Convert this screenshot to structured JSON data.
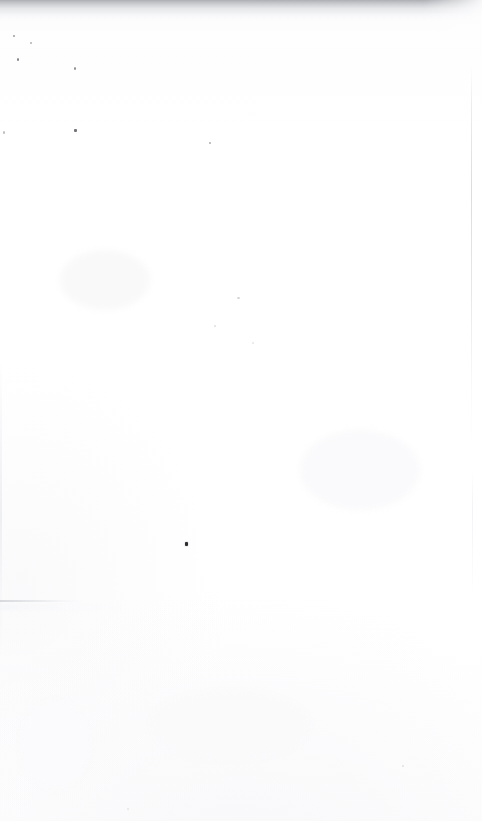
{
  "page": {
    "kind": "scanned-document-page",
    "state": "blank",
    "body_text": "",
    "width_px": 482,
    "height_px": 821,
    "background_color": "#ffffff",
    "paper_tone": "#fdfdfe"
  },
  "artifacts": {
    "top_band": {
      "name": "top-edge-shadow-band",
      "color": "#96989e",
      "height_px": 26,
      "description": "dark speckled gradient along the top scan edge"
    },
    "specks": [
      {
        "x": 13,
        "y": 35,
        "w": 2,
        "h": 2,
        "color": "#7a7c82"
      },
      {
        "x": 17,
        "y": 58,
        "w": 2,
        "h": 3,
        "color": "#5e6066"
      },
      {
        "x": 30,
        "y": 42,
        "w": 2,
        "h": 2,
        "color": "#8c8e94"
      },
      {
        "x": 74,
        "y": 67,
        "w": 2,
        "h": 3,
        "color": "#6e7076"
      },
      {
        "x": 74,
        "y": 129,
        "w": 3,
        "h": 3,
        "color": "#5a5c62"
      },
      {
        "x": 3,
        "y": 131,
        "w": 2,
        "h": 3,
        "color": "#9a9ca2"
      },
      {
        "x": 209,
        "y": 142,
        "w": 2,
        "h": 2,
        "color": "#8a8c92"
      },
      {
        "x": 237,
        "y": 297,
        "w": 3,
        "h": 2,
        "color": "#b4b6bc"
      },
      {
        "x": 214,
        "y": 325,
        "w": 2,
        "h": 2,
        "color": "#c2c4ca"
      },
      {
        "x": 252,
        "y": 342,
        "w": 2,
        "h": 2,
        "color": "#ccced4"
      },
      {
        "x": 185,
        "y": 542,
        "w": 3,
        "h": 4,
        "color": "#2b2d33"
      },
      {
        "x": 402,
        "y": 765,
        "w": 2,
        "h": 2,
        "color": "#c6c8ce"
      },
      {
        "x": 127,
        "y": 808,
        "w": 2,
        "h": 2,
        "color": "#cacccf"
      }
    ],
    "rules": [
      {
        "name": "right-page-edge-line",
        "x": 471,
        "y": 66,
        "length": 380,
        "orientation": "vertical",
        "color": "#d0d1d6"
      },
      {
        "name": "right-page-edge-line-lower",
        "x": 472,
        "y": 470,
        "length": 130,
        "orientation": "vertical",
        "color": "#e6e7eb"
      },
      {
        "name": "left-page-edge-line",
        "x": 0,
        "y": 360,
        "length": 300,
        "orientation": "vertical",
        "color": "#e9eaee"
      },
      {
        "name": "lower-left-crease-line",
        "x": 0,
        "y": 600,
        "length": 82,
        "orientation": "horizontal",
        "color": "#ced0d5"
      }
    ],
    "smudges": [
      {
        "x": 60,
        "y": 250,
        "w": 90,
        "h": 60,
        "color": "#fbfbfc"
      },
      {
        "x": 300,
        "y": 430,
        "w": 120,
        "h": 80,
        "color": "#fcfcfd"
      },
      {
        "x": 150,
        "y": 690,
        "w": 160,
        "h": 70,
        "color": "#fbfbfd"
      },
      {
        "x": 20,
        "y": 700,
        "w": 70,
        "h": 90,
        "color": "#fcfcfe"
      }
    ]
  }
}
